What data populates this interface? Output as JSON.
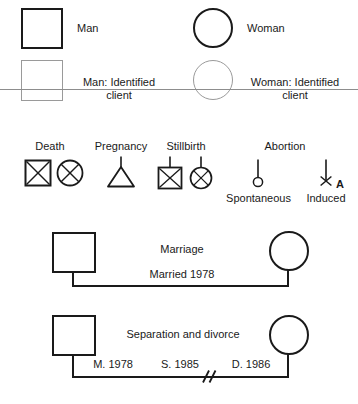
{
  "figure": {
    "panel_letter": "A",
    "stroke_color": "#1a1a1a",
    "light_stroke_color": "#9a9a9a",
    "background_color": "#ffffff"
  },
  "legend_row_basic": {
    "man_label": "Man",
    "woman_label": "Woman"
  },
  "legend_row_identified": {
    "man_ic_label": "Man: Identified client",
    "woman_ic_label": "Woman: Identified client"
  },
  "events_row": {
    "death_label": "Death",
    "pregnancy_label": "Pregnancy",
    "stillbirth_label": "Stillbirth",
    "abortion_label": "Abortion",
    "spontaneous_label": "Spontaneous",
    "induced_label": "Induced"
  },
  "marriage_row": {
    "title": "Marriage",
    "detail": "Married 1978"
  },
  "divorce_row": {
    "title": "Separation and divorce",
    "married_date": "M. 1978",
    "separated_date": "S. 1985",
    "divorced_date": "D. 1986"
  }
}
